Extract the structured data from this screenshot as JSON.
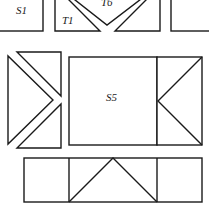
{
  "diagram": {
    "title": "",
    "labels": {
      "s1": "S1",
      "t1": "T1",
      "t6": "T6",
      "s5": "S5"
    },
    "colors": {
      "stroke": "#1a1a1a",
      "fill": "#ffffff",
      "background": "#ffffff"
    },
    "pieces": [
      {
        "id": "S1",
        "type": "square",
        "row": "top"
      },
      {
        "id": "T1",
        "type": "triangle",
        "row": "top"
      },
      {
        "id": "T6",
        "type": "triangle",
        "row": "top"
      },
      {
        "id": "top-right-triangle",
        "type": "triangle",
        "row": "top"
      },
      {
        "id": "top-right-square",
        "type": "square",
        "row": "top"
      },
      {
        "id": "left-triangle",
        "type": "triangle",
        "row": "middle"
      },
      {
        "id": "upper-right-triangle",
        "type": "triangle",
        "row": "middle"
      },
      {
        "id": "lower-right-triangle",
        "type": "triangle",
        "row": "middle"
      },
      {
        "id": "S5",
        "type": "square",
        "row": "middle"
      },
      {
        "id": "s5-right-box",
        "type": "rectangle-with-triangles",
        "row": "middle"
      },
      {
        "id": "bottom-strip",
        "type": "rectangle-with-triangle",
        "row": "bottom"
      }
    ]
  }
}
